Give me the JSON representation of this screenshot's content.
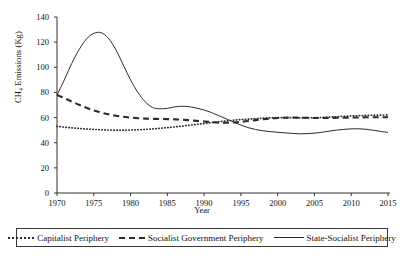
{
  "chart_data": {
    "type": "line",
    "title": "",
    "xlabel": "Year",
    "ylabel": "CH₄ Emissions (Kg)",
    "xlim": [
      1970,
      2015
    ],
    "ylim": [
      0,
      140
    ],
    "xticks": [
      "1970",
      "1975",
      "1980",
      "1985",
      "1990",
      "1995",
      "2000",
      "2005",
      "2010",
      "2015"
    ],
    "yticks": [
      "0",
      "20",
      "40",
      "60",
      "80",
      "100",
      "120",
      "140"
    ],
    "grid": false,
    "legend_position": "below-axes",
    "x": [
      1970,
      1971,
      1972,
      1973,
      1974,
      1975,
      1976,
      1977,
      1978,
      1979,
      1980,
      1981,
      1982,
      1983,
      1984,
      1985,
      1986,
      1987,
      1988,
      1989,
      1990,
      1991,
      1992,
      1993,
      1994,
      1995,
      1996,
      1997,
      1998,
      1999,
      2000,
      2001,
      2002,
      2003,
      2004,
      2005,
      2006,
      2007,
      2008,
      2009,
      2010,
      2011,
      2012,
      2013,
      2014,
      2015
    ],
    "series": [
      {
        "name": "Capitalist Periphery",
        "style": "dotted",
        "color": "#2b2b2b",
        "values": [
          53.0,
          52.4,
          51.8,
          51.3,
          50.9,
          50.6,
          50.3,
          50.1,
          50.0,
          50.0,
          50.1,
          50.3,
          50.6,
          51.0,
          51.5,
          52.0,
          52.6,
          53.2,
          53.9,
          54.6,
          55.3,
          56.0,
          56.7,
          57.3,
          57.9,
          58.4,
          58.8,
          59.2,
          59.5,
          59.8,
          60.0,
          60.0,
          59.9,
          59.8,
          59.8,
          59.9,
          60.1,
          60.4,
          60.7,
          61.0,
          61.3,
          61.5,
          61.7,
          61.9,
          62.0,
          62.1
        ]
      },
      {
        "name": "Socialist Government Periphery",
        "style": "dashed",
        "color": "#2b2b2b",
        "values": [
          78.0,
          75.5,
          72.8,
          70.2,
          67.8,
          65.7,
          64.0,
          62.6,
          61.5,
          60.6,
          60.0,
          59.5,
          59.2,
          59.0,
          58.9,
          58.8,
          58.6,
          58.3,
          57.9,
          57.4,
          56.9,
          56.4,
          56.0,
          55.9,
          56.1,
          56.6,
          57.3,
          58.0,
          58.7,
          59.3,
          59.7,
          59.9,
          60.0,
          59.9,
          59.8,
          59.7,
          59.7,
          59.7,
          59.8,
          59.9,
          60.0,
          60.1,
          60.2,
          60.2,
          60.2,
          60.2
        ]
      },
      {
        "name": "State-Socialist Periphery",
        "style": "solid",
        "color": "#2b2b2b",
        "values": [
          78.0,
          90.0,
          103.0,
          114.0,
          122.5,
          127.0,
          127.5,
          123.0,
          114.0,
          102.0,
          90.0,
          80.0,
          72.5,
          68.0,
          67.0,
          67.3,
          68.5,
          69.0,
          68.6,
          67.5,
          66.0,
          64.0,
          61.5,
          59.0,
          56.5,
          54.0,
          52.0,
          50.5,
          49.5,
          48.8,
          48.3,
          47.8,
          47.4,
          47.1,
          47.2,
          47.6,
          48.3,
          49.2,
          50.0,
          50.6,
          51.0,
          51.1,
          50.7,
          49.9,
          49.0,
          48.2
        ]
      }
    ]
  },
  "legend": {
    "items": [
      {
        "label": "Capitalist Periphery",
        "swatch": "dotted-line-swatch"
      },
      {
        "label": "Socialist Government Periphery",
        "swatch": "dashed-line-swatch"
      },
      {
        "label": "State-Socialist Periphery",
        "swatch": "solid-line-swatch"
      }
    ]
  }
}
